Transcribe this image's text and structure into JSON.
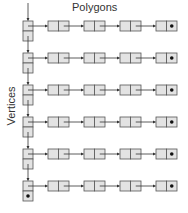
{
  "diagram": {
    "title": "Polygons",
    "side_label": "Vertices",
    "rows": 6,
    "nodes_per_row": 4,
    "terminator_symbol": "null-dot",
    "colors": {
      "box_fill": "#e3e3e3",
      "box_stroke": "#555555",
      "arrow": "#333333",
      "dot": "#111111"
    }
  }
}
